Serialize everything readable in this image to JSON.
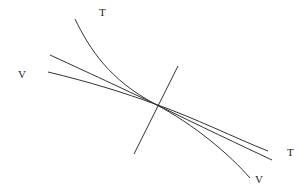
{
  "diagram": {
    "labels": {
      "top_T": "T",
      "left_V": "V",
      "right_T": "T",
      "bottom_V": "V"
    },
    "curves": [
      {
        "name": "T-curve-steep",
        "description": "steep curve from upper-left labeled T bending to lower-right labeled V"
      },
      {
        "name": "line-upper",
        "description": "straight-ish line from left through intersection to right labeled T"
      },
      {
        "name": "line-lower",
        "description": "gently sloped line from left labeled V through intersection"
      },
      {
        "name": "crossing-line",
        "description": "steep line crossing all curves at common point"
      }
    ],
    "colors": {
      "stroke": "#333333",
      "background": "#ffffff"
    }
  }
}
